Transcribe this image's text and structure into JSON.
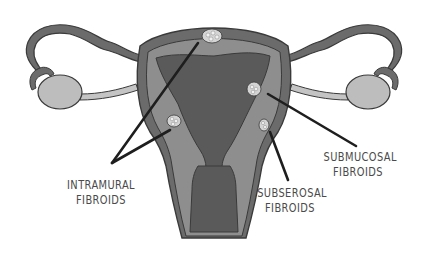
{
  "colors": {
    "background": "#ffffff",
    "outline": "#3a3a3a",
    "outer_wall": "#6b6b6b",
    "muscle_layer": "#8e8e8e",
    "cavity": "#5a5a5a",
    "ovary": "#bdbdbd",
    "ligament": "#c4c4c4",
    "fibroid": "#d4d4d4",
    "pointer_line": "#1e1e1e",
    "label_text": "#4a4a4a"
  },
  "labels": {
    "intramural": {
      "line1": "INTRAMURAL",
      "line2": "FIBROIDS"
    },
    "subserosal": {
      "line1": "SUBSEROSAL",
      "line2": "FIBROIDS"
    },
    "submucosal": {
      "line1": "SUBMUCOSAL",
      "line2": "FIBROIDS"
    }
  },
  "structures": [
    "fallopian-tube-left",
    "fallopian-tube-right",
    "ovary-left",
    "ovary-right",
    "uterus",
    "uterine-cavity",
    "cervix"
  ],
  "fibroids": [
    {
      "type": "intramural",
      "position": "fundus-top"
    },
    {
      "type": "intramural",
      "position": "left-wall"
    },
    {
      "type": "submucosal",
      "position": "right-cavity-wall"
    },
    {
      "type": "subserosal",
      "position": "right-outer-wall"
    }
  ]
}
